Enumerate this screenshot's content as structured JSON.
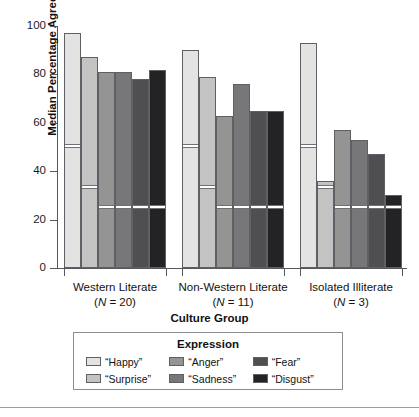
{
  "chart_data": {
    "type": "bar",
    "title": "",
    "xlabel": "Culture Group",
    "ylabel": "Median Percentage Agreement",
    "ylim": [
      0,
      100
    ],
    "yticks": [
      0,
      20,
      40,
      60,
      80,
      100
    ],
    "grid": false,
    "legend_title": "Expression",
    "legend_position": "bottom",
    "categories": [
      "Western Literate",
      "Non-Western Literate",
      "Isolated Illiterate"
    ],
    "category_sublabels": [
      "(N = 20)",
      "(N = 11)",
      "(N = 3)"
    ],
    "category_n": [
      20,
      11,
      3
    ],
    "series": [
      {
        "name": "“Happy”",
        "color": "#e3e3e1",
        "values": [
          97,
          90,
          93
        ],
        "reference_line": 50
      },
      {
        "name": "“Surprise”",
        "color": "#c3c3c1",
        "values": [
          87,
          79,
          36
        ],
        "reference_line": 33
      },
      {
        "name": "“Anger”",
        "color": "#949492",
        "values": [
          81,
          63,
          57
        ],
        "reference_line": 25
      },
      {
        "name": "“Sadness”",
        "color": "#77777a",
        "values": [
          81,
          76,
          53
        ],
        "reference_line": 25
      },
      {
        "name": "“Fear”",
        "color": "#4f4f52",
        "values": [
          78,
          65,
          47
        ],
        "reference_line": 25
      },
      {
        "name": "“Disgust”",
        "color": "#232326",
        "values": [
          82,
          65,
          30
        ],
        "reference_line": 25
      }
    ]
  },
  "axis": {
    "y_title": "Median Percentage Agreement",
    "x_title": "Culture Group",
    "y_tick_labels": [
      "100",
      "80",
      "60",
      "40",
      "20",
      "0"
    ]
  },
  "legend": {
    "title": "Expression",
    "entries": [
      {
        "label": "“Happy”",
        "color": "#e3e3e1"
      },
      {
        "label": "“Surprise”",
        "color": "#c3c3c1"
      },
      {
        "label": "“Anger”",
        "color": "#949492"
      },
      {
        "label": "“Sadness”",
        "color": "#77777a"
      },
      {
        "label": "“Fear”",
        "color": "#4f4f52"
      },
      {
        "label": "“Disgust”",
        "color": "#232326"
      }
    ]
  },
  "groups": [
    {
      "label": "Western Literate",
      "sublabel_prefix": "N",
      "sublabel_value": "= 20"
    },
    {
      "label": "Non-Western Literate",
      "sublabel_prefix": "N",
      "sublabel_value": "= 11"
    },
    {
      "label": "Isolated Illiterate",
      "sublabel_prefix": "N",
      "sublabel_value": "= 3"
    }
  ]
}
